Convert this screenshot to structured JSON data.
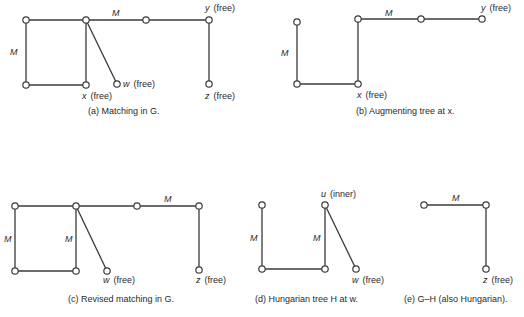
{
  "panels": [
    {
      "id": "a",
      "caption": "(a)  Matching in G.",
      "caption_pos": [
        88,
        114
      ],
      "nodes": [
        {
          "id": "a1",
          "x": 26,
          "y": 20
        },
        {
          "id": "a2",
          "x": 86,
          "y": 20
        },
        {
          "id": "a3",
          "x": 26,
          "y": 85
        },
        {
          "id": "x",
          "x": 86,
          "y": 85,
          "label": "x",
          "note": "(free)",
          "lx": 82,
          "ly": 99
        },
        {
          "id": "w",
          "x": 117,
          "y": 84,
          "label": "w",
          "note": "(free)",
          "lx": 123,
          "ly": 87
        },
        {
          "id": "a4",
          "x": 146,
          "y": 20
        },
        {
          "id": "y",
          "x": 209,
          "y": 20,
          "label": "y",
          "note": "(free)",
          "lx": 205,
          "ly": 11
        },
        {
          "id": "z",
          "x": 209,
          "y": 84,
          "label": "z",
          "note": "(free)",
          "lx": 205,
          "ly": 99
        }
      ],
      "edges": [
        {
          "from": "a1",
          "to": "a2"
        },
        {
          "from": "a1",
          "to": "a3",
          "matched": true,
          "mlabel": "M",
          "mx": 10,
          "my": 55
        },
        {
          "from": "a3",
          "to": "x"
        },
        {
          "from": "a2",
          "to": "x"
        },
        {
          "from": "a2",
          "to": "w"
        },
        {
          "from": "a2",
          "to": "a4",
          "matched": true,
          "mlabel": "M",
          "mx": 112,
          "my": 16
        },
        {
          "from": "a4",
          "to": "y"
        },
        {
          "from": "y",
          "to": "z"
        }
      ]
    },
    {
      "id": "b",
      "caption": "(b)  Augmenting tree at x.",
      "caption_pos": [
        356,
        114
      ],
      "nodes": [
        {
          "id": "b1",
          "x": 297,
          "y": 22
        },
        {
          "id": "b3",
          "x": 297,
          "y": 84
        },
        {
          "id": "bx",
          "x": 358,
          "y": 84,
          "label": "x",
          "note": "(free)",
          "lx": 357,
          "ly": 98
        },
        {
          "id": "b2",
          "x": 358,
          "y": 19
        },
        {
          "id": "b4",
          "x": 421,
          "y": 19
        },
        {
          "id": "by",
          "x": 482,
          "y": 19,
          "label": "y",
          "note": "(free)",
          "lx": 481,
          "ly": 11
        }
      ],
      "edges": [
        {
          "from": "b1",
          "to": "b3",
          "matched": true,
          "mlabel": "M",
          "mx": 281,
          "my": 56
        },
        {
          "from": "b3",
          "to": "bx"
        },
        {
          "from": "bx",
          "to": "b2"
        },
        {
          "from": "b2",
          "to": "b4",
          "matched": true,
          "mlabel": "M",
          "mx": 385,
          "my": 16
        },
        {
          "from": "b4",
          "to": "by"
        }
      ]
    },
    {
      "id": "c",
      "caption": "(c)  Revised matching in G.",
      "caption_pos": [
        68,
        302
      ],
      "nodes": [
        {
          "id": "c1",
          "x": 15,
          "y": 206
        },
        {
          "id": "c2",
          "x": 76,
          "y": 206
        },
        {
          "id": "c3",
          "x": 15,
          "y": 271
        },
        {
          "id": "c4",
          "x": 76,
          "y": 271
        },
        {
          "id": "cw",
          "x": 107,
          "y": 271,
          "label": "w",
          "note": "(free)",
          "lx": 103,
          "ly": 283
        },
        {
          "id": "c5",
          "x": 137,
          "y": 206
        },
        {
          "id": "c6",
          "x": 199,
          "y": 206
        },
        {
          "id": "cz",
          "x": 199,
          "y": 270,
          "label": "z",
          "note": "(free)",
          "lx": 196,
          "ly": 283
        }
      ],
      "edges": [
        {
          "from": "c1",
          "to": "c2"
        },
        {
          "from": "c1",
          "to": "c3",
          "matched": true,
          "mlabel": "M",
          "mx": 4,
          "my": 242
        },
        {
          "from": "c3",
          "to": "c4"
        },
        {
          "from": "c2",
          "to": "c4",
          "matched": true,
          "mlabel": "M",
          "mx": 65,
          "my": 242
        },
        {
          "from": "c2",
          "to": "cw"
        },
        {
          "from": "c2",
          "to": "c5"
        },
        {
          "from": "c5",
          "to": "c6",
          "matched": true,
          "mlabel": "M",
          "mx": 164,
          "my": 202
        },
        {
          "from": "c6",
          "to": "cz"
        }
      ]
    },
    {
      "id": "d",
      "caption": "(d)  Hungarian tree H at w.",
      "caption_pos": [
        255,
        302
      ],
      "nodes": [
        {
          "id": "d1",
          "x": 262,
          "y": 205
        },
        {
          "id": "d3",
          "x": 262,
          "y": 269
        },
        {
          "id": "d4",
          "x": 325,
          "y": 269
        },
        {
          "id": "du",
          "x": 325,
          "y": 205,
          "label": "u",
          "note": "(inner)",
          "lx": 321,
          "ly": 197
        },
        {
          "id": "dw",
          "x": 356,
          "y": 269,
          "label": "w",
          "note": "(free)",
          "lx": 352,
          "ly": 283
        }
      ],
      "edges": [
        {
          "from": "d1",
          "to": "d3",
          "matched": true,
          "mlabel": "M",
          "mx": 250,
          "my": 241
        },
        {
          "from": "d3",
          "to": "d4"
        },
        {
          "from": "d4",
          "to": "du",
          "matched": true,
          "mlabel": "M",
          "mx": 313,
          "my": 241
        },
        {
          "from": "du",
          "to": "dw"
        }
      ]
    },
    {
      "id": "e",
      "caption": "(e)  G–H (also Hungarian).",
      "caption_pos": [
        404,
        302
      ],
      "nodes": [
        {
          "id": "e1",
          "x": 424,
          "y": 205
        },
        {
          "id": "e2",
          "x": 486,
          "y": 205
        },
        {
          "id": "ez",
          "x": 486,
          "y": 269,
          "label": "z",
          "note": "(free)",
          "lx": 483,
          "ly": 283
        }
      ],
      "edges": [
        {
          "from": "e1",
          "to": "e2",
          "matched": true,
          "mlabel": "M",
          "mx": 452,
          "my": 201
        },
        {
          "from": "e2",
          "to": "ez"
        }
      ]
    }
  ],
  "style": {
    "line_color": "#3a3a3a",
    "node_fill": "#ffffff",
    "text_color": "#2a2a2a",
    "node_radius": 3.2
  }
}
